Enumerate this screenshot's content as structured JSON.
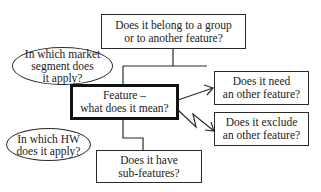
{
  "diagram": {
    "central": {
      "lines": [
        "Feature –",
        "what does it mean?"
      ]
    },
    "top": {
      "lines": [
        "Does it belong to a group",
        "or to another feature?"
      ]
    },
    "market": {
      "lines": [
        "In which market",
        "segment does",
        "it apply?"
      ]
    },
    "hardware": {
      "lines": [
        "In which HW",
        "does it apply?"
      ]
    },
    "needs": {
      "lines": [
        "Does it need",
        "an other feature?"
      ]
    },
    "excludes": {
      "lines": [
        "Does it exclude",
        "an other feature?"
      ]
    },
    "subfeatures": {
      "lines": [
        "Does it have",
        "sub-features?"
      ]
    },
    "colors": {
      "stroke": "#2a2a2a",
      "background": "#ffffff"
    }
  }
}
